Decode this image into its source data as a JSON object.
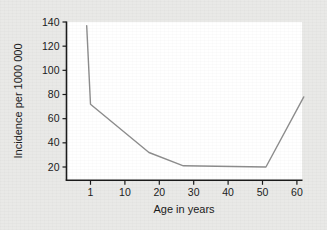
{
  "chart_data": {
    "type": "line",
    "title": "",
    "subtitle": "",
    "xlabel": "Age in years",
    "ylabel": "Incidence per 1000 000",
    "x_ticks": [
      1,
      10,
      20,
      30,
      40,
      50,
      60
    ],
    "x_tick_labels": [
      "1",
      "10",
      "20",
      "30",
      "40",
      "50",
      "60"
    ],
    "y_ticks": [
      20,
      40,
      60,
      80,
      100,
      120,
      140
    ],
    "y_tick_labels": [
      "20",
      "40",
      "60",
      "80",
      "100",
      "120",
      "140"
    ],
    "ylim": [
      12,
      140
    ],
    "xlim": [
      0,
      62
    ],
    "grid": false,
    "legend": null,
    "legend_position": "none",
    "axis_style": "left-and-bottom-spines",
    "series": [
      {
        "name": "Incidence",
        "color": "#8d8d8d",
        "line_width": 1.4,
        "markers": false,
        "x": [
          0,
          1,
          17,
          27,
          51,
          62
        ],
        "values": [
          137,
          72,
          32,
          21,
          20,
          78
        ],
        "points": [
          {
            "age": 0,
            "incidence": 137
          },
          {
            "age": 1,
            "incidence": 72
          },
          {
            "age": 17,
            "incidence": 32
          },
          {
            "age": 27,
            "incidence": 21
          },
          {
            "age": 51,
            "incidence": 20
          },
          {
            "age": 62,
            "incidence": 78
          }
        ]
      }
    ],
    "annotations": []
  },
  "figure": {
    "background_color": "#e9e9e7",
    "plot_background_color": "#ffffff",
    "axis_color": "#1b1b1b",
    "text_color": "#1b1b1b",
    "line_color": "#8d8d8d"
  }
}
